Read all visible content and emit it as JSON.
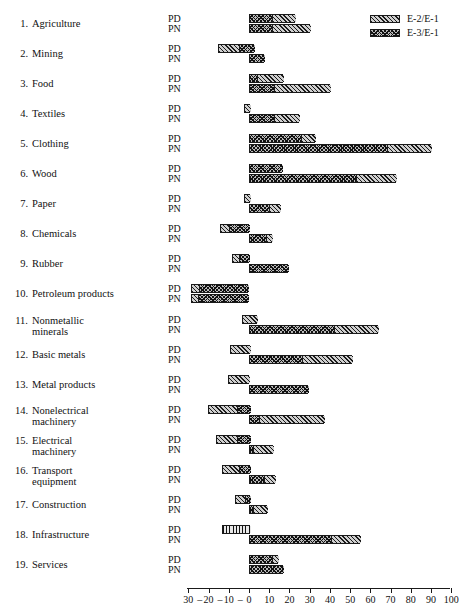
{
  "chart_data": {
    "type": "bar",
    "orientation": "horizontal",
    "title": "",
    "xlabel": "",
    "ylabel": "",
    "xlim": [
      -30,
      100
    ],
    "xticks": [
      -30,
      -20,
      -10,
      0,
      10,
      20,
      30,
      40,
      50,
      60,
      70,
      80,
      90,
      100
    ],
    "xtick_labels": [
      "-30",
      "-20",
      "-10",
      "0",
      "10",
      "20",
      "30",
      "40",
      "50",
      "60",
      "70",
      "80",
      "90",
      "100"
    ],
    "grid": false,
    "legend_position": "top-right",
    "legend": [
      {
        "key": "e2",
        "label": "E-2/E-1",
        "pattern": "diagonal-hatch"
      },
      {
        "key": "e3",
        "label": "E-3/E-1",
        "pattern": "cross-hatch"
      }
    ],
    "subrow_labels": [
      "PD",
      "PN"
    ],
    "categories": [
      {
        "num": "1.",
        "name": "Agriculture",
        "name2": ""
      },
      {
        "num": "2.",
        "name": "Mining",
        "name2": ""
      },
      {
        "num": "3.",
        "name": "Food",
        "name2": ""
      },
      {
        "num": "4.",
        "name": "Textiles",
        "name2": ""
      },
      {
        "num": "5.",
        "name": "Clothing",
        "name2": ""
      },
      {
        "num": "6.",
        "name": "Wood",
        "name2": ""
      },
      {
        "num": "7.",
        "name": "Paper",
        "name2": ""
      },
      {
        "num": "8.",
        "name": "Chemicals",
        "name2": ""
      },
      {
        "num": "9.",
        "name": "Rubber",
        "name2": ""
      },
      {
        "num": "10.",
        "name": "Petroleum products",
        "name2": ""
      },
      {
        "num": "11.",
        "name": "Nonmetallic",
        "name2": "minerals"
      },
      {
        "num": "12.",
        "name": "Basic metals",
        "name2": ""
      },
      {
        "num": "13.",
        "name": "Metal products",
        "name2": ""
      },
      {
        "num": "14.",
        "name": "Nonelectrical",
        "name2": "machinery"
      },
      {
        "num": "15.",
        "name": "Electrical",
        "name2": "machinery"
      },
      {
        "num": "16.",
        "name": "Transport",
        "name2": "equipment"
      },
      {
        "num": "17.",
        "name": "Construction",
        "name2": ""
      },
      {
        "num": "18.",
        "name": "Infrastructure",
        "name2": ""
      },
      {
        "num": "19.",
        "name": "Services",
        "name2": ""
      }
    ],
    "bars": [
      {
        "category": "Agriculture",
        "PD": [
          {
            "series": "E-3/E-1",
            "from": 0,
            "to": 11
          },
          {
            "series": "E-2/E-1",
            "from": 11,
            "to": 22.5
          }
        ],
        "PN": [
          {
            "series": "E-3/E-1",
            "from": 0,
            "to": 11
          },
          {
            "series": "E-2/E-1",
            "from": 11,
            "to": 30
          }
        ]
      },
      {
        "category": "Mining",
        "PD": [
          {
            "series": "E-2/E-1",
            "from": -15.5,
            "to": -5.5
          },
          {
            "series": "E-3/E-1",
            "from": -5.5,
            "to": 2.5
          }
        ],
        "PN": [
          {
            "series": "E-3/E-1",
            "from": 0,
            "to": 7.5
          }
        ]
      },
      {
        "category": "Food",
        "PD": [
          {
            "series": "E-3/E-1",
            "from": 0,
            "to": 3.5
          },
          {
            "series": "E-2/E-1",
            "from": 3.5,
            "to": 17
          }
        ],
        "PN": [
          {
            "series": "E-3/E-1",
            "from": 0,
            "to": 12
          },
          {
            "series": "E-2/E-1",
            "from": 12,
            "to": 40
          }
        ]
      },
      {
        "category": "Textiles",
        "PD": [
          {
            "series": "E-2/E-1",
            "from": -2.5,
            "to": 0.5
          }
        ],
        "PN": [
          {
            "series": "E-3/E-1",
            "from": 0,
            "to": 12
          },
          {
            "series": "E-2/E-1",
            "from": 12,
            "to": 24.5
          }
        ]
      },
      {
        "category": "Clothing",
        "PD": [
          {
            "series": "E-3/E-1",
            "from": 0,
            "to": 25
          },
          {
            "series": "E-2/E-1",
            "from": 25,
            "to": 32.5
          }
        ],
        "PN": [
          {
            "series": "E-3/E-1",
            "from": 0,
            "to": 67.5
          },
          {
            "series": "E-2/E-1",
            "from": 67.5,
            "to": 90
          }
        ]
      },
      {
        "category": "Wood",
        "PD": [
          {
            "series": "E-3/E-1",
            "from": 0,
            "to": 16.5
          }
        ],
        "PN": [
          {
            "series": "E-3/E-1",
            "from": 0,
            "to": 52.5
          },
          {
            "series": "E-2/E-1",
            "from": 52.5,
            "to": 72.5
          }
        ]
      },
      {
        "category": "Paper",
        "PD": [
          {
            "series": "E-2/E-1",
            "from": -2.5,
            "to": 0.5
          }
        ],
        "PN": [
          {
            "series": "E-3/E-1",
            "from": 0,
            "to": 9.5
          },
          {
            "series": "E-2/E-1",
            "from": 9.5,
            "to": 15.5
          }
        ]
      },
      {
        "category": "Chemicals",
        "PD": [
          {
            "series": "E-2/E-1",
            "from": -14.5,
            "to": -10.5
          },
          {
            "series": "E-3/E-1",
            "from": -10.5,
            "to": 0
          }
        ],
        "PN": [
          {
            "series": "E-3/E-1",
            "from": 0,
            "to": 8
          },
          {
            "series": "E-2/E-1",
            "from": 8,
            "to": 11.5
          }
        ]
      },
      {
        "category": "Rubber",
        "PD": [
          {
            "series": "E-2/E-1",
            "from": -8.5,
            "to": -5.5
          },
          {
            "series": "E-3/E-1",
            "from": -5.5,
            "to": 0
          }
        ],
        "PN": [
          {
            "series": "E-3/E-1",
            "from": 0,
            "to": 19.5
          }
        ]
      },
      {
        "category": "Petroleum products",
        "PD": [
          {
            "series": "E-2/E-1",
            "from": -28.5,
            "to": -25
          },
          {
            "series": "E-3/E-1",
            "from": -25,
            "to": -0.5
          }
        ],
        "PN": [
          {
            "series": "E-2/E-1",
            "from": -28.5,
            "to": -25.5
          },
          {
            "series": "E-3/E-1",
            "from": -25.5,
            "to": -0.5
          }
        ]
      },
      {
        "category": "Nonmetallic minerals",
        "PD": [
          {
            "series": "E-2/E-1",
            "from": -3.5,
            "to": 4
          }
        ],
        "PN": [
          {
            "series": "E-3/E-1",
            "from": 0,
            "to": 41.5
          },
          {
            "series": "E-2/E-1",
            "from": 41.5,
            "to": 64
          }
        ]
      },
      {
        "category": "Basic metals",
        "PD": [
          {
            "series": "E-2/E-1",
            "from": -9.5,
            "to": 0.5
          }
        ],
        "PN": [
          {
            "series": "E-3/E-1",
            "from": 0,
            "to": 25.5
          },
          {
            "series": "E-2/E-1",
            "from": 25.5,
            "to": 51
          }
        ]
      },
      {
        "category": "Metal products",
        "PD": [
          {
            "series": "E-2/E-1",
            "from": -10.5,
            "to": 0
          }
        ],
        "PN": [
          {
            "series": "E-3/E-1",
            "from": 0,
            "to": 29
          }
        ]
      },
      {
        "category": "Nonelectrical machinery",
        "PD": [
          {
            "series": "E-2/E-1",
            "from": -20.5,
            "to": -6.5
          },
          {
            "series": "E-3/E-1",
            "from": -6.5,
            "to": 0.5
          }
        ],
        "PN": [
          {
            "series": "E-3/E-1",
            "from": 0,
            "to": 4.5
          },
          {
            "series": "E-2/E-1",
            "from": 4.5,
            "to": 37
          }
        ]
      },
      {
        "category": "Electrical machinery",
        "PD": [
          {
            "series": "E-2/E-1",
            "from": -16.5,
            "to": -6.5
          },
          {
            "series": "E-3/E-1",
            "from": -6.5,
            "to": 0.5
          }
        ],
        "PN": [
          {
            "series": "E-3/E-1",
            "from": 0,
            "to": 1.5
          },
          {
            "series": "E-2/E-1",
            "from": 1.5,
            "to": 12
          }
        ]
      },
      {
        "category": "Transport equipment",
        "PD": [
          {
            "series": "E-2/E-1",
            "from": -13.5,
            "to": -5.5
          },
          {
            "series": "E-3/E-1",
            "from": -5.5,
            "to": 0.5
          }
        ],
        "PN": [
          {
            "series": "E-3/E-1",
            "from": 0,
            "to": 7
          },
          {
            "series": "E-2/E-1",
            "from": 7,
            "to": 13
          }
        ]
      },
      {
        "category": "Construction",
        "PD": [
          {
            "series": "E-2/E-1",
            "from": -7,
            "to": -2.5
          },
          {
            "series": "E-3/E-1",
            "from": -2.5,
            "to": 0.5
          }
        ],
        "PN": [
          {
            "series": "E-3/E-1",
            "from": 0,
            "to": 1.5
          },
          {
            "series": "E-2/E-1",
            "from": 1.5,
            "to": 9
          }
        ]
      },
      {
        "category": "Infrastructure",
        "PD": [
          {
            "series": "E-2/E-1",
            "from": -13.5,
            "to": 0.5
          }
        ],
        "PN": [
          {
            "series": "E-3/E-1",
            "from": 0,
            "to": 40
          },
          {
            "series": "E-2/E-1",
            "from": 40,
            "to": 55
          }
        ]
      },
      {
        "category": "Services",
        "PD": [
          {
            "series": "E-3/E-1",
            "from": 0,
            "to": 11
          },
          {
            "series": "E-2/E-1",
            "from": 11,
            "to": 14.5
          }
        ],
        "PN": [
          {
            "series": "E-3/E-1",
            "from": 0,
            "to": 17
          }
        ]
      }
    ]
  }
}
